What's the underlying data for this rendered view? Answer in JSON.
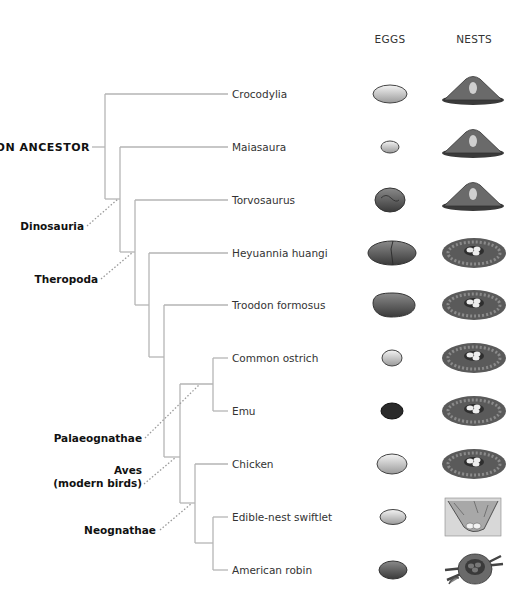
{
  "columns": {
    "eggs": "EGGS",
    "nests": "NESTS"
  },
  "colors": {
    "branch_line": "#b5b5b5",
    "clade_pointer": "#9a9a9a",
    "label_text": "#333333",
    "clade_text": "#111111"
  },
  "root_label": "COMMON ANCESTOR",
  "clades": [
    {
      "id": "dinosauria",
      "label": "Dinosauria"
    },
    {
      "id": "theropoda",
      "label": "Theropoda"
    },
    {
      "id": "palaeognathae",
      "label": "Palaeognathae"
    },
    {
      "id": "aves",
      "label": "Aves",
      "sublabel": "(modern birds)"
    },
    {
      "id": "neognathae",
      "label": "Neognathae"
    }
  ],
  "taxa": [
    {
      "name": "Crocodylia",
      "egg": "large-pale-oval",
      "nest": "mound"
    },
    {
      "name": "Maiasaura",
      "egg": "small-pale-oval",
      "nest": "mound"
    },
    {
      "name": "Torvosaurus",
      "egg": "round-textured-dark",
      "nest": "mound"
    },
    {
      "name": "Heyuannia huangi",
      "egg": "elongated-dark-cracked",
      "nest": "open-bowl"
    },
    {
      "name": "Troodon formosus",
      "egg": "elongated-dark",
      "nest": "open-bowl"
    },
    {
      "name": "Common ostrich",
      "egg": "small-pale-round",
      "nest": "open-bowl"
    },
    {
      "name": "Emu",
      "egg": "dark-green-oval",
      "nest": "open-bowl"
    },
    {
      "name": "Chicken",
      "egg": "medium-pale-oval",
      "nest": "open-bowl"
    },
    {
      "name": "Edible-nest swiftlet",
      "egg": "small-pale-oval",
      "nest": "cliff-cup"
    },
    {
      "name": "American robin",
      "egg": "medium-dark-oval",
      "nest": "twig-cup"
    }
  ]
}
